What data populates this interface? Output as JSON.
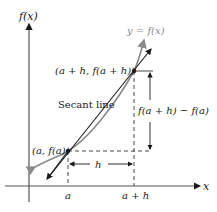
{
  "diagram": {
    "axes": {
      "y_label": "f(x)",
      "x_label": "x"
    },
    "curve_label": "y = f(x)",
    "secant_label": "Secant line",
    "points": {
      "p1": "(a, f(a))",
      "p2": "(a + h, f(a + h))"
    },
    "ticks": {
      "a": "a",
      "a_plus_h": "a + h"
    },
    "dimensions": {
      "horizontal": "h",
      "vertical": "f(a + h) − f(a)"
    },
    "colors": {
      "curve": "#8a8a8a",
      "lines": "#1a1a1a",
      "axis": "#555555"
    }
  }
}
